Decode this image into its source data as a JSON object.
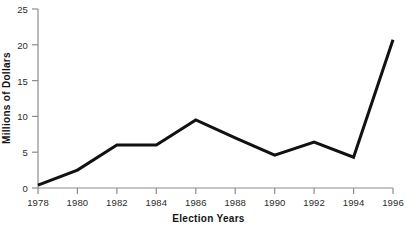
{
  "chart_data": {
    "type": "line",
    "title": "",
    "subtitle": "",
    "xlabel": "Election Years",
    "ylabel": "Millions of Dollars",
    "categories": [
      "1978",
      "1980",
      "1982",
      "1984",
      "1986",
      "1988",
      "1990",
      "1992",
      "1994",
      "1996"
    ],
    "x": [
      1978,
      1980,
      1982,
      1984,
      1986,
      1988,
      1990,
      1992,
      1994,
      1996
    ],
    "values": [
      0.4,
      2.5,
      6.0,
      6.0,
      9.5,
      7.0,
      4.6,
      6.4,
      4.3,
      20.7
    ],
    "series": [
      {
        "name": "",
        "values": [
          0.4,
          2.5,
          6.0,
          6.0,
          9.5,
          7.0,
          4.6,
          6.4,
          4.3,
          20.7
        ]
      }
    ],
    "xlim": [
      1978,
      1996
    ],
    "ylim": [
      0,
      25
    ],
    "yticks": [
      0,
      5,
      10,
      15,
      20,
      25
    ],
    "ytick_labels": [
      "0",
      "5",
      "10",
      "15",
      "20",
      "25"
    ],
    "xticks": [
      1978,
      1980,
      1982,
      1984,
      1986,
      1988,
      1990,
      1992,
      1994,
      1996
    ],
    "xtick_labels": [
      "1978",
      "1980",
      "1982",
      "1984",
      "1986",
      "1988",
      "1990",
      "1992",
      "1994",
      "1996"
    ],
    "grid": false,
    "legend": false,
    "legend_position": "none",
    "annotations": [],
    "colors": {
      "line": "#111111",
      "axis": "#8c8c8c",
      "tick_label": "#2b2b2b",
      "axis_title": "#131313",
      "background": "#ffffff"
    },
    "line_width": 3
  }
}
